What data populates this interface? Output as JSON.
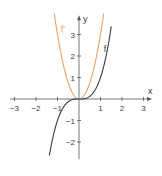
{
  "chart_data": {
    "type": "line",
    "title": "",
    "xlabel": "x",
    "ylabel": "y",
    "xlim": [
      -3.2,
      3.4
    ],
    "ylim": [
      -2.8,
      3.9
    ],
    "grid": false,
    "x_ticks": [
      "−3",
      "−2",
      "−1",
      "1",
      "2",
      "3"
    ],
    "y_ticks": [
      "−2",
      "−1",
      "1",
      "2",
      "3"
    ],
    "series": [
      {
        "name": "f",
        "label": "f",
        "formula": "x^3",
        "color": "#3c3c3c",
        "x": [
          -1.4,
          -1.0,
          -0.5,
          0,
          0.5,
          1.0,
          1.5
        ],
        "y": [
          -2.74,
          -1.0,
          -0.125,
          0,
          0.125,
          1.0,
          3.375
        ]
      },
      {
        "name": "f'",
        "label": "f'",
        "formula": "3x^2",
        "color": "#f0a064",
        "x": [
          -1.15,
          -1.0,
          -0.5,
          0,
          0.5,
          1.0,
          1.15
        ],
        "y": [
          3.97,
          3.0,
          0.75,
          0,
          0.75,
          3.0,
          3.97
        ]
      }
    ]
  }
}
